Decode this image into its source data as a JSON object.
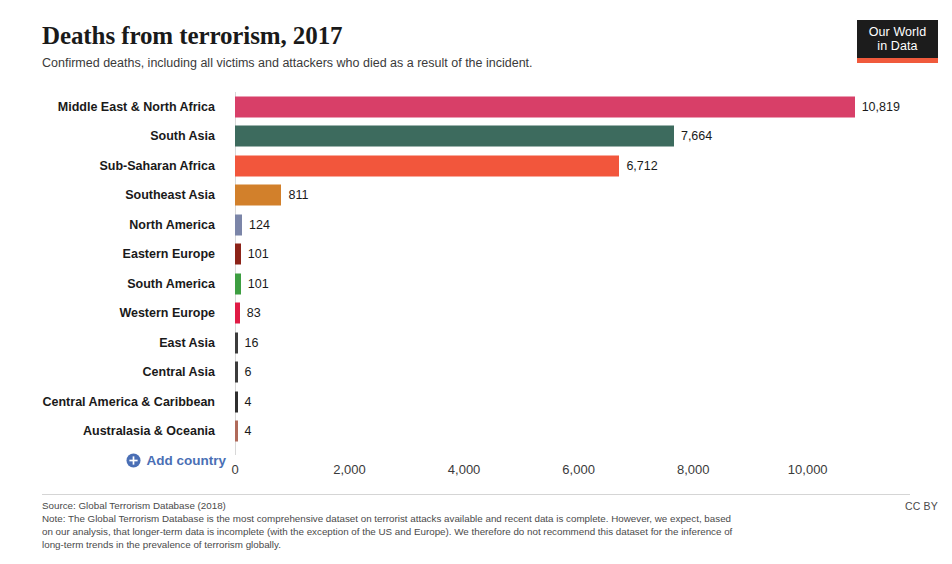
{
  "header": {
    "title": "Deaths from terrorism, 2017",
    "subtitle": "Confirmed deaths, including all victims and attackers who died as a result of the incident."
  },
  "logo": {
    "line1": "Our World",
    "line2": "in Data",
    "box_color": "#1c1c1c",
    "bar_color": "#f05a3c"
  },
  "controls": {
    "add_country_label": "Add country",
    "add_country_icon": "plus-circle-icon",
    "accent_color": "#4a6fb5"
  },
  "footer": {
    "source": "Source: Global Terrorism Database (2018)",
    "note": "Note: The Global Terrorism Database is the most comprehensive dataset on terrorist attacks available and recent data is complete. However, we expect, based on our analysis, that longer-term data is incomplete (with the exception of the US and Europe). We therefore do not recommend this dataset for the inference of long-term trends in the prevalence of terrorism globally.",
    "license": "CC BY"
  },
  "chart_data": {
    "type": "bar",
    "orientation": "horizontal",
    "title": "Deaths from terrorism, 2017",
    "subtitle": "Confirmed deaths, including all victims and attackers who died as a result of the incident.",
    "xlabel": "",
    "ylabel": "",
    "xlim": [
      0,
      11500
    ],
    "grid": false,
    "legend": false,
    "xticks": [
      0,
      2000,
      4000,
      6000,
      8000,
      10000
    ],
    "xticklabels": [
      "0",
      "2,000",
      "4,000",
      "6,000",
      "8,000",
      "10,000"
    ],
    "categories": [
      "Middle East & North Africa",
      "South Asia",
      "Sub-Saharan Africa",
      "Southeast Asia",
      "North America",
      "Eastern Europe",
      "South America",
      "Western Europe",
      "East Asia",
      "Central Asia",
      "Central America & Caribbean",
      "Australasia & Oceania"
    ],
    "values": [
      10819,
      7664,
      6712,
      811,
      124,
      101,
      101,
      83,
      16,
      6,
      4,
      4
    ],
    "value_labels": [
      "10,819",
      "7,664",
      "6,712",
      "811",
      "124",
      "101",
      "101",
      "83",
      "16",
      "6",
      "4",
      "4"
    ],
    "colors": [
      "#d83f68",
      "#3d6b5e",
      "#f2563c",
      "#d2802b",
      "#7b85a8",
      "#8c2318",
      "#3d9e41",
      "#e01b45",
      "#3c3c3c",
      "#3c3c3c",
      "#2e2e2e",
      "#b06a5a"
    ]
  }
}
